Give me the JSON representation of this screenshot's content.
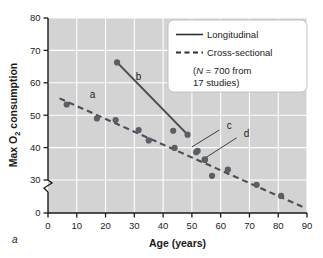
{
  "chart_data": {
    "type": "scatter",
    "title": "",
    "xlabel": "Age (years)",
    "ylabel": "Max O₂ consumption",
    "ylabel_main": "Max O",
    "ylabel_sub": "2",
    "ylabel_tail": " consumption",
    "xlim": [
      0,
      90
    ],
    "ylim": [
      0,
      80
    ],
    "y_axis_break": true,
    "y_break_between": [
      0,
      30
    ],
    "grid": true,
    "grid_color": "#ffffff",
    "plot_background": "#d3d3d3",
    "marker_color": "#5a5f66",
    "line_color": "#4a4f56",
    "xticks": [
      0,
      10,
      20,
      30,
      40,
      50,
      60,
      70,
      80,
      90
    ],
    "yticks": [
      0,
      30,
      40,
      50,
      60,
      70,
      80
    ],
    "ytick_labels": [
      "0",
      "30",
      "40",
      "50",
      "60",
      "70",
      "80"
    ],
    "legend_position": "top-right",
    "series": [
      {
        "name": "Longitudinal",
        "style": "solid",
        "line_endpoints": [
          [
            24,
            66.3
          ],
          [
            48.5,
            44.0
          ]
        ],
        "points": [
          [
            24.0,
            66.3
          ],
          [
            43.5,
            45.2
          ],
          [
            48.5,
            44.0
          ],
          [
            52.0,
            39.0
          ],
          [
            54.5,
            36.2
          ],
          [
            57.0,
            31.3
          ]
        ]
      },
      {
        "name": "Cross-sectional",
        "style": "dashed",
        "line_endpoints": [
          [
            4.0,
            55.2
          ],
          [
            89.0,
            21.5
          ]
        ],
        "points": [
          [
            6.5,
            53.3
          ],
          [
            17.0,
            49.0
          ],
          [
            23.5,
            48.5
          ],
          [
            31.5,
            45.4
          ],
          [
            35.0,
            42.2
          ],
          [
            44.0,
            39.9
          ],
          [
            51.5,
            38.6
          ],
          [
            54.5,
            36.4
          ],
          [
            62.5,
            33.2
          ],
          [
            72.5,
            28.5
          ],
          [
            81.0,
            25.1
          ]
        ]
      }
    ],
    "annotations": [
      {
        "label": "a",
        "x": 15.5,
        "y": 55.3
      },
      {
        "label": "b",
        "x": 31.5,
        "y": 61.0
      },
      {
        "label": "c",
        "x": 63.0,
        "y": 45.8
      },
      {
        "label": "d",
        "x": 69.0,
        "y": 43.4
      }
    ],
    "leader_lines": [
      {
        "from": [
          59.5,
          45.4
        ],
        "to": [
          50.0,
          40.2
        ],
        "for": "c"
      },
      {
        "from": [
          65.5,
          43.0
        ],
        "to": [
          55.0,
          37.0
        ],
        "for": "d"
      }
    ]
  },
  "legend": {
    "items": [
      {
        "label": "Longitudinal",
        "style": "solid"
      },
      {
        "label": "Cross-sectional",
        "style": "dashed"
      }
    ],
    "note_line1_open": "(",
    "note_line1_italic": "N",
    "note_line1_rest": " = 700 from",
    "note_line2": "17 studies)"
  },
  "panel": {
    "label": "a"
  }
}
